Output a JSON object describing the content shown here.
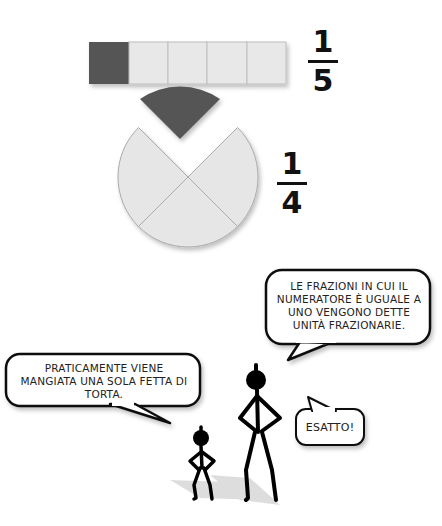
{
  "bar_model": {
    "segments": 5,
    "shaded": 1,
    "shaded_color": "#555555",
    "empty_color": "#e8e8e8"
  },
  "fraction_bar": {
    "numerator": "1",
    "denominator": "5"
  },
  "pie_model": {
    "slices": 4,
    "shaded": 1,
    "shaded_color": "#555555",
    "empty_color": "#e6e6e6"
  },
  "fraction_pie": {
    "numerator": "1",
    "denominator": "4"
  },
  "speech": {
    "tall_figure": "LE FRAZIONI IN CUI IL NUMERATORE È UGUALE A UNO VENGONO DETTE UNITÀ FRAZIONARIE.",
    "small_figure": "PRATICAMENTE VIENE MANGIATA UNA SOLA FETTA DI TORTA.",
    "reply": "ESATTO!"
  }
}
